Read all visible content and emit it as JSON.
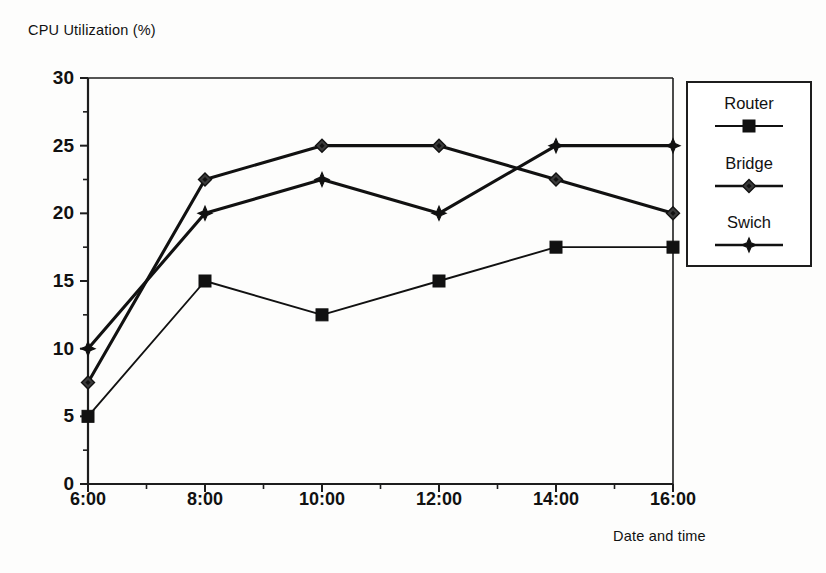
{
  "chart_data": {
    "type": "line",
    "title": "",
    "xlabel": "Date and time",
    "ylabel": "CPU Utilization (%)",
    "categories": [
      "6:00",
      "8:00",
      "10:00",
      "12:00",
      "14:00",
      "16:00"
    ],
    "x": [
      6,
      8,
      10,
      12,
      14,
      16
    ],
    "xlim": [
      6,
      16
    ],
    "ylim": [
      0,
      30
    ],
    "ytick_labels": [
      "0",
      "5",
      "10",
      "15",
      "20",
      "25",
      "30"
    ],
    "ytick_values": [
      0,
      5,
      10,
      15,
      20,
      25,
      30
    ],
    "yminor_step": 2.5,
    "grid": false,
    "legend_position": "right-outside",
    "series": [
      {
        "name": "Router",
        "marker": "square",
        "color": "#111111",
        "values": [
          5,
          15,
          12.5,
          15,
          17.5,
          17.5
        ]
      },
      {
        "name": "Bridge",
        "marker": "diamond",
        "color": "#111111",
        "values": [
          7.5,
          22.5,
          25,
          25,
          22.5,
          20
        ]
      },
      {
        "name": "Swich",
        "marker": "star",
        "color": "#111111",
        "values": [
          10,
          20,
          22.5,
          20,
          25,
          25
        ]
      }
    ]
  },
  "axes": {
    "y_axis_title": "CPU Utilization (%)",
    "x_axis_title": "Date and time"
  },
  "legend": {
    "entries": [
      {
        "label": "Router",
        "marker": "square"
      },
      {
        "label": "Bridge",
        "marker": "diamond"
      },
      {
        "label": "Swich",
        "marker": "star"
      }
    ]
  },
  "colors": {
    "line": "#111111",
    "frame": "#1d1d1d",
    "background": "#fdfdfc"
  }
}
